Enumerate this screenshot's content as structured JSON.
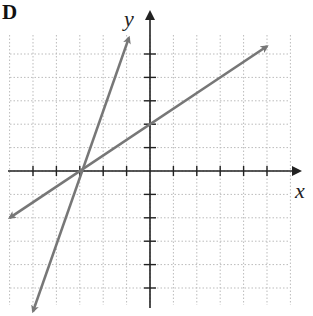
{
  "figure_label": "D",
  "chart_data": {
    "type": "line",
    "title": "",
    "xlabel": "x",
    "ylabel": "y",
    "xlim": [
      -6,
      6
    ],
    "ylim": [
      -6,
      6
    ],
    "grid": true,
    "tick_spacing": 1,
    "tick_labels": "none",
    "series": [
      {
        "name": "line-1",
        "equation": "y = (2/3)x + 2",
        "slope": 0.6667,
        "intercept": 2,
        "points": [
          [
            -6,
            -2
          ],
          [
            -3,
            0
          ],
          [
            0,
            2
          ],
          [
            5,
            5.33
          ]
        ],
        "color": "#777777",
        "arrows": "both"
      },
      {
        "name": "line-2",
        "equation": "y = 3x + 9",
        "slope": 3,
        "intercept": 9,
        "points": [
          [
            -5,
            -6
          ],
          [
            -3,
            0
          ],
          [
            -2,
            3
          ],
          [
            -0.9,
            5.7
          ]
        ],
        "color": "#777777",
        "arrows": "both"
      }
    ],
    "intersection": [
      -3,
      0
    ]
  },
  "colors": {
    "line": "#777777",
    "axis": "#222222",
    "grid": "#bbbbbb"
  }
}
